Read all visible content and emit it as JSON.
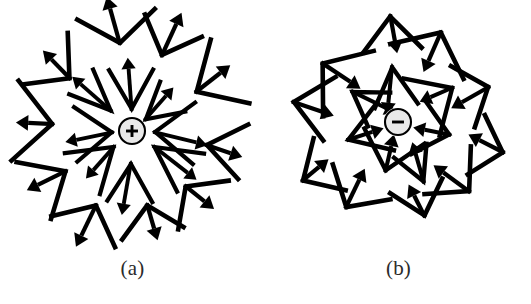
{
  "figure": {
    "background_color": "#ffffff",
    "ink_color": "#000000",
    "caption_color": "#2b2b2b"
  },
  "panels": [
    {
      "id": "a",
      "caption": "(a)",
      "charge": {
        "sign": "+",
        "polarity": "positive",
        "cx": 132,
        "cy": 131,
        "r": 13,
        "fill_color": "#e9e9e9",
        "stroke_color": "#000000"
      },
      "field_direction": "outward",
      "inner_ring": {
        "count": 8,
        "description": "chevrons with vertex toward charge, arrows radiating outward",
        "radius": 26,
        "chevron_arm": 46,
        "chevron_half_angle": 30,
        "arrow_length": 50,
        "stroke_width": 4.2,
        "angles": [
          90,
          45,
          0,
          325,
          270,
          225,
          180,
          135
        ]
      },
      "outer_ring": {
        "count": 10,
        "description": "larger chevrons with vertex toward charge, arrows radiating outward",
        "radius": 84,
        "chevron_arm": 50,
        "chevron_half_angle": 45,
        "arrow_length": 44,
        "stroke_width": 4.6,
        "angles": [
          96,
          62,
          28,
          352,
          318,
          284,
          250,
          216,
          176,
          136
        ]
      }
    },
    {
      "id": "b",
      "caption": "(b)",
      "charge": {
        "sign": "−",
        "polarity": "negative",
        "cx": 132,
        "cy": 122,
        "r": 13,
        "fill_color": "#e9e9e9",
        "stroke_color": "#000000"
      },
      "field_direction": "inward",
      "inner_ring": {
        "count": 7,
        "description": "chevrons with vertex away from charge, arrows pointing inward",
        "radius": 58,
        "chevron_arm": 46,
        "chevron_half_angle": 36,
        "arrow_length": 44,
        "stroke_width": 4.4,
        "angles": [
          92,
          38,
          346,
          300,
          256,
          198,
          144
        ]
      },
      "outer_ring": {
        "count": 10,
        "description": "larger chevrons with vertex away from charge, arrows pointing inward",
        "radius": 104,
        "chevron_arm": 48,
        "chevron_half_angle": 44,
        "arrow_length": 42,
        "stroke_width": 4.6,
        "angles": [
          100,
          64,
          26,
          350,
          316,
          282,
          244,
          208,
          172,
          136
        ]
      }
    }
  ],
  "chart_data": {
    "type": "scatter",
    "xlabel": "",
    "ylabel": "",
    "subplots": [
      {
        "label": "(a)",
        "charge_sign": "+",
        "field_direction": "outward (away from charge)",
        "vector_count": 18
      },
      {
        "label": "(b)",
        "charge_sign": "−",
        "field_direction": "inward (toward charge)",
        "vector_count": 17
      }
    ]
  }
}
